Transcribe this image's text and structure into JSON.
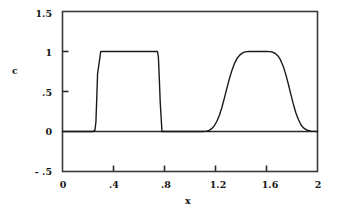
{
  "chart_data": {
    "type": "line",
    "title": "",
    "xlabel": "x",
    "ylabel": "c",
    "xlim": [
      0,
      2
    ],
    "ylim": [
      -0.5,
      1.5
    ],
    "grid": false,
    "legend": null,
    "xticks": [
      {
        "value": 0,
        "label": "0"
      },
      {
        "value": 0.4,
        "label": ".4"
      },
      {
        "value": 0.8,
        "label": ".8"
      },
      {
        "value": 1.2,
        "label": "1.2"
      },
      {
        "value": 1.6,
        "label": "1.6"
      },
      {
        "value": 2,
        "label": "2"
      }
    ],
    "yticks": [
      {
        "value": 1.5,
        "label": "1.5"
      },
      {
        "value": 1,
        "label": "1"
      },
      {
        "value": 0.5,
        "label": ".5"
      },
      {
        "value": 0,
        "label": "0"
      },
      {
        "value": -0.5,
        "label": "- .5"
      }
    ],
    "series": [
      {
        "name": "c",
        "color": "#1a1a1a",
        "linewidth": 1.4,
        "x": [
          0.0,
          0.05,
          0.1,
          0.15,
          0.2,
          0.24,
          0.255,
          0.262,
          0.268,
          0.275,
          0.3,
          0.35,
          0.4,
          0.45,
          0.5,
          0.55,
          0.6,
          0.65,
          0.7,
          0.745,
          0.752,
          0.758,
          0.766,
          0.78,
          0.82,
          0.88,
          0.95,
          1.0,
          1.05,
          1.1,
          1.13,
          1.15,
          1.17,
          1.19,
          1.21,
          1.23,
          1.25,
          1.27,
          1.29,
          1.31,
          1.33,
          1.35,
          1.37,
          1.39,
          1.41,
          1.43,
          1.46,
          1.5,
          1.55,
          1.6,
          1.63,
          1.65,
          1.67,
          1.69,
          1.71,
          1.73,
          1.75,
          1.77,
          1.79,
          1.81,
          1.83,
          1.85,
          1.87,
          1.89,
          1.92,
          1.95,
          2.0
        ],
        "y": [
          0.0,
          0.0,
          0.0,
          0.0,
          0.0,
          0.0,
          0.02,
          0.12,
          0.38,
          0.72,
          1.0,
          1.0,
          1.0,
          1.0,
          1.0,
          1.0,
          1.0,
          1.0,
          1.0,
          1.0,
          0.93,
          0.72,
          0.38,
          0.0,
          0.0,
          0.0,
          0.0,
          0.0,
          0.0,
          0.0,
          0.005,
          0.015,
          0.035,
          0.07,
          0.125,
          0.2,
          0.3,
          0.42,
          0.545,
          0.665,
          0.77,
          0.855,
          0.915,
          0.955,
          0.98,
          0.995,
          1.0,
          1.0,
          1.0,
          1.0,
          0.998,
          0.99,
          0.975,
          0.945,
          0.895,
          0.82,
          0.72,
          0.6,
          0.47,
          0.345,
          0.235,
          0.15,
          0.085,
          0.045,
          0.015,
          0.005,
          0.0
        ]
      }
    ],
    "axes": {
      "frame_color": "#3a3a3a",
      "zero_line": true,
      "zero_line_value": 0
    }
  }
}
